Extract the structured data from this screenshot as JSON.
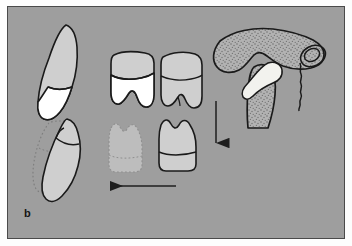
{
  "figure": {
    "panel_label": "b",
    "background_color": "#9e9e9e",
    "border_color": "#4a4a4a",
    "outline_color": "#1a1a1a",
    "enamel_color": "#ffffff",
    "dentin_color": "#cfcfcf",
    "ghost_color": "#b8b8b8",
    "bone_fill_color": "#b0b0b0",
    "disc_color": "#f2f2ee",
    "caption": "b"
  },
  "structures": {
    "upper_incisor": {
      "name": "upper incisor",
      "crown_fill": "#cfcfcf",
      "root_fill": "#ffffff"
    },
    "lower_incisor": {
      "name": "lower incisor displaced",
      "crown_fill": "#cfcfcf"
    },
    "ghost_incisor": {
      "name": "original incisor position outline",
      "style": "dotted"
    },
    "upper_molars": {
      "name": "upper molar crowns",
      "count": 2,
      "crown_fill": "#cfcfcf",
      "pulp_fill": "#ffffff"
    },
    "lower_molars": {
      "name": "lower molar crowns",
      "count": 2,
      "ghost_count": 1,
      "crown_fill": "#cfcfcf"
    },
    "tmj": {
      "name": "temporomandibular joint",
      "parts": [
        "temporal bone",
        "articular eminence",
        "articular disc",
        "mandibular condyle",
        "external auditory meatus"
      ],
      "bone_texture": "stippled"
    }
  },
  "arrows": [
    {
      "name": "horizontal-arrow",
      "direction": "left",
      "x1": 175,
      "y1": 185,
      "x2": 108,
      "y2": 185
    },
    {
      "name": "vertical-arrow",
      "direction": "down",
      "x1": 215,
      "y1": 100,
      "x2": 215,
      "y2": 149
    }
  ]
}
